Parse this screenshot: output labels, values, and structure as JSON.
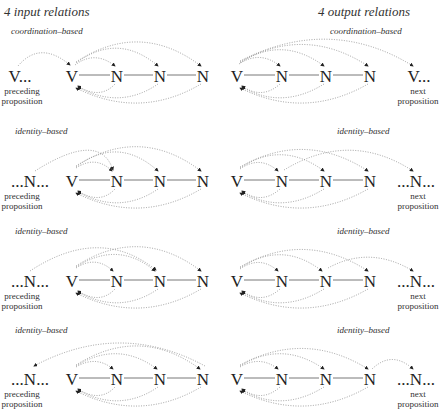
{
  "headers": {
    "left": "4 input relations",
    "right": "4 output relations"
  },
  "panels": [
    {
      "side": "left",
      "row": 0,
      "relation_type": "coordination-based",
      "external_node": "V",
      "external_suffix": "...",
      "external_prefix": "",
      "caption": [
        "preceding",
        "proposition"
      ],
      "chain": [
        "V",
        "N",
        "N",
        "N"
      ]
    },
    {
      "side": "right",
      "row": 0,
      "relation_type": "coordination-based",
      "external_node": "V",
      "external_suffix": "...",
      "external_prefix": "",
      "caption": [
        "next",
        "proposition"
      ],
      "chain": [
        "V",
        "N",
        "N",
        "N"
      ]
    },
    {
      "side": "left",
      "row": 1,
      "relation_type": "identity-based",
      "external_node": "N",
      "external_suffix": "...",
      "external_prefix": "...",
      "caption": [
        "preceding",
        "proposition"
      ],
      "chain": [
        "V",
        "N",
        "N",
        "N"
      ]
    },
    {
      "side": "right",
      "row": 1,
      "relation_type": "identity-based",
      "external_node": "N",
      "external_suffix": "...",
      "external_prefix": "...",
      "caption": [
        "next",
        "proposition"
      ],
      "chain": [
        "V",
        "N",
        "N",
        "N"
      ]
    },
    {
      "side": "left",
      "row": 2,
      "relation_type": "identity-based",
      "external_node": "N",
      "external_suffix": "...",
      "external_prefix": "...",
      "caption": [
        "preceding",
        "proposition"
      ],
      "chain": [
        "V",
        "N",
        "N",
        "N"
      ]
    },
    {
      "side": "right",
      "row": 2,
      "relation_type": "identity-based",
      "external_node": "N",
      "external_suffix": "...",
      "external_prefix": "...",
      "caption": [
        "next",
        "proposition"
      ],
      "chain": [
        "V",
        "N",
        "N",
        "N"
      ]
    },
    {
      "side": "left",
      "row": 3,
      "relation_type": "identity-based",
      "external_node": "N",
      "external_suffix": "...",
      "external_prefix": "...",
      "caption": [
        "preceding",
        "proposition"
      ],
      "chain": [
        "V",
        "N",
        "N",
        "N"
      ]
    },
    {
      "side": "right",
      "row": 3,
      "relation_type": "identity-based",
      "external_node": "N",
      "external_suffix": "...",
      "external_prefix": "...",
      "caption": [
        "next",
        "proposition"
      ],
      "chain": [
        "V",
        "N",
        "N",
        "N"
      ]
    }
  ],
  "labels": {
    "coord": "coordination–based",
    "ident": "identity–based",
    "preceding": "preceding",
    "next": "next",
    "proposition": "proposition",
    "V": "V",
    "N": "N",
    "Vdots": "V...",
    "Ndots": "...N..."
  },
  "colors": {
    "edge": "#555555",
    "dotted": "#888888",
    "text": "#222222"
  }
}
